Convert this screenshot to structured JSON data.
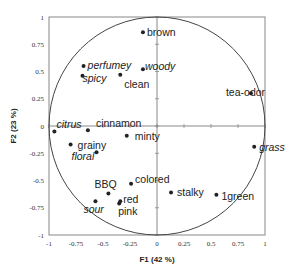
{
  "chart_data": {
    "type": "scatter",
    "subtype": "pca-correlation-circle",
    "title": "",
    "xlabel": "F1 (42 %)",
    "ylabel": "F2 (23 %)",
    "xlim": [
      -1,
      1
    ],
    "ylim": [
      -1,
      1
    ],
    "x_ticks": [
      "-1",
      "-0.75",
      "-0.5",
      "-0.25",
      "0",
      "0.25",
      "0.5",
      "0.75",
      "1"
    ],
    "y_ticks": [
      "1",
      "0.75",
      "0.5",
      "0.25",
      "0",
      "-0.25",
      "-0.5",
      "-0.75",
      "-1"
    ],
    "grid": false,
    "unit_circle": true,
    "legend": null,
    "points": [
      {
        "label": "brown",
        "x": -0.13,
        "y": 0.86,
        "italic": false,
        "lx": 4,
        "ly": 4
      },
      {
        "label": "perfumey",
        "x": -0.68,
        "y": 0.55,
        "italic": true,
        "lx": 4,
        "ly": 3
      },
      {
        "label": "woody",
        "x": -0.13,
        "y": 0.52,
        "italic": true,
        "lx": 2,
        "ly": 1
      },
      {
        "label": "spicy",
        "x": -0.69,
        "y": 0.46,
        "italic": true,
        "lx": 0,
        "ly": 6
      },
      {
        "label": "clean",
        "x": -0.34,
        "y": 0.47,
        "italic": false,
        "lx": 4,
        "ly": 13
      },
      {
        "label": "tea-odor",
        "x": 0.87,
        "y": 0.3,
        "italic": false,
        "lx": -25,
        "ly": 3
      },
      {
        "label": "citrus",
        "x": -0.95,
        "y": -0.05,
        "italic": true,
        "lx": 2,
        "ly": -3
      },
      {
        "label": "cinnamon",
        "x": -0.64,
        "y": -0.04,
        "italic": false,
        "lx": 8,
        "ly": -3
      },
      {
        "label": "minty",
        "x": -0.28,
        "y": -0.09,
        "italic": false,
        "lx": 8,
        "ly": 4
      },
      {
        "label": "grainy",
        "x": -0.8,
        "y": -0.17,
        "italic": false,
        "lx": 7,
        "ly": 4
      },
      {
        "label": "floral",
        "x": -0.56,
        "y": -0.24,
        "italic": true,
        "lx": -25,
        "ly": 8
      },
      {
        "label": "grass",
        "x": 0.9,
        "y": -0.19,
        "italic": true,
        "lx": 5,
        "ly": 4
      },
      {
        "label": "BBQ",
        "x": -0.45,
        "y": -0.62,
        "italic": false,
        "lx": -14,
        "ly": -6
      },
      {
        "label": "colored",
        "x": -0.24,
        "y": -0.53,
        "italic": false,
        "lx": 4,
        "ly": -1
      },
      {
        "label": "red",
        "x": -0.34,
        "y": -0.69,
        "italic": false,
        "lx": 3,
        "ly": 2
      },
      {
        "label": "pink",
        "x": -0.35,
        "y": -0.71,
        "italic": false,
        "lx": -1,
        "ly": 12
      },
      {
        "label": "sour",
        "x": -0.57,
        "y": -0.69,
        "italic": true,
        "lx": -12,
        "ly": 12
      },
      {
        "label": "stalky",
        "x": 0.13,
        "y": -0.61,
        "italic": false,
        "lx": 6,
        "ly": 4
      },
      {
        "label": "1green",
        "x": 0.55,
        "y": -0.63,
        "italic": false,
        "lx": 5,
        "ly": 5
      }
    ],
    "colors": {
      "point": "#222222",
      "axis": "#888888",
      "circle": "#444444",
      "frame": "#888888"
    }
  }
}
